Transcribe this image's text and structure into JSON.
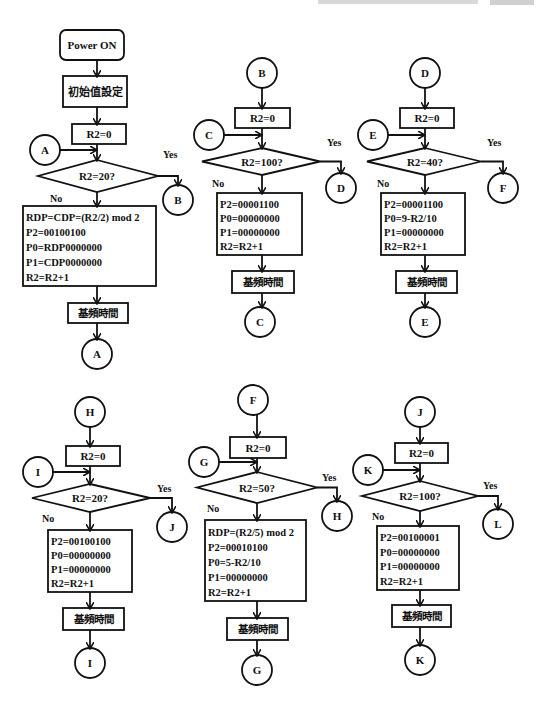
{
  "page": {
    "header_partial": "",
    "stroke_color": "#111111",
    "background": "#ffffff"
  },
  "flowcharts": [
    {
      "id": "main",
      "start": "Power ON",
      "init": "初始值設定",
      "reset": "R2=0",
      "entry_connector": "A",
      "decision": "R2=20?",
      "yes_label": "Yes",
      "no_label": "No",
      "yes_connector": "B",
      "process": [
        "RDP=CDP=(R2/2) mod 2",
        "P2=00100100",
        "P0=RDP0000000",
        "P1=CDP0000000",
        "R2=R2+1"
      ],
      "delay": "基頻時間",
      "end_connector": "A"
    },
    {
      "id": "B",
      "top_connector": "B",
      "reset": "R2=0",
      "entry_connector": "C",
      "decision": "R2=100?",
      "yes_label": "Yes",
      "no_label": "No",
      "yes_connector": "D",
      "process": [
        "P2=00001100",
        "P0=00000000",
        "P1=00000000",
        "R2=R2+1"
      ],
      "delay": "基頻時間",
      "end_connector": "C"
    },
    {
      "id": "D",
      "top_connector": "D",
      "reset": "R2=0",
      "entry_connector": "E",
      "decision": "R2=40?",
      "yes_label": "Yes",
      "no_label": "No",
      "yes_connector": "F",
      "process": [
        "P2=00001100",
        "P0=9-R2/10",
        "P1=00000000",
        "R2=R2+1"
      ],
      "delay": "基頻時間",
      "end_connector": "E"
    },
    {
      "id": "H",
      "top_connector": "H",
      "reset": "R2=0",
      "entry_connector": "I",
      "decision": "R2=20?",
      "yes_label": "Yes",
      "no_label": "No",
      "yes_connector": "J",
      "process": [
        "P2=00100100",
        "P0=00000000",
        "P1=00000000",
        "R2=R2+1"
      ],
      "delay": "基頻時間",
      "end_connector": "I"
    },
    {
      "id": "F",
      "top_connector": "F",
      "reset": "R2=0",
      "entry_connector": "G",
      "decision": "R2=50?",
      "yes_label": "Yes",
      "no_label": "No",
      "yes_connector": "H",
      "process": [
        "RDP=(R2/5) mod 2",
        "P2=00010100",
        "P0=5-R2/10",
        "P1=00000000",
        "R2=R2+1"
      ],
      "delay": "基頻時間",
      "end_connector": "G"
    },
    {
      "id": "J",
      "top_connector": "J",
      "reset": "R2=0",
      "entry_connector": "K",
      "decision": "R2=100?",
      "yes_label": "Yes",
      "no_label": "No",
      "yes_connector": "L",
      "process": [
        "P2=00100001",
        "P0=00000000",
        "P1=00000000",
        "R2=R2+1"
      ],
      "delay": "基頻時間",
      "end_connector": "K"
    }
  ]
}
